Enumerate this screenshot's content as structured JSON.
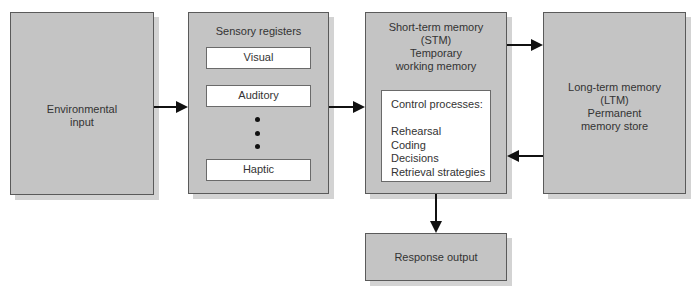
{
  "diagram": {
    "environmental_input": {
      "line1": "Environmental",
      "line2": "input"
    },
    "sensory_registers": {
      "title": "Sensory registers",
      "items": [
        "Visual",
        "Auditory",
        "Haptic"
      ],
      "ellipsis": "•••"
    },
    "short_term_memory": {
      "line1": "Short-term memory",
      "line2": "(STM)",
      "line3": "Temporary",
      "line4": "working memory",
      "control_processes": {
        "title": "Control processes:",
        "items": [
          "Rehearsal",
          "Coding",
          "Decisions",
          "Retrieval strategies"
        ]
      }
    },
    "long_term_memory": {
      "line1": "Long-term memory",
      "line2": "(LTM)",
      "line3": "Permanent",
      "line4": "memory store"
    },
    "response_output": {
      "label": "Response output"
    },
    "colors": {
      "box_fill": "#c4c4c4",
      "border": "#5a5a5a",
      "shadow": "#d3d3d3",
      "arrow": "#111111"
    }
  }
}
